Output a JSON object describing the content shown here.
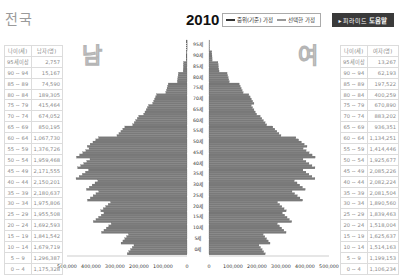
{
  "header": {
    "region": "전국",
    "year": "2010",
    "legend": {
      "baseline_label": "중위(기준) 가정",
      "selected_label": "선택한 가정"
    },
    "help_button": {
      "prefix": "▸ 피라미드",
      "label": "도움말"
    }
  },
  "male_table": {
    "headers": [
      "나이(세)",
      "남자(명)"
    ],
    "big_char": "남",
    "rows": [
      {
        "age": "95세이상",
        "value": "2,757"
      },
      {
        "age": "90 ~ 94",
        "value": "15,167"
      },
      {
        "age": "85 ~ 89",
        "value": "74,590"
      },
      {
        "age": "80 ~ 84",
        "value": "189,305"
      },
      {
        "age": "75 ~ 79",
        "value": "415,464"
      },
      {
        "age": "70 ~ 74",
        "value": "674,052"
      },
      {
        "age": "65 ~ 69",
        "value": "850,195"
      },
      {
        "age": "60 ~ 64",
        "value": "1,067,730"
      },
      {
        "age": "55 ~ 59",
        "value": "1,376,726"
      },
      {
        "age": "50 ~ 54",
        "value": "1,959,468"
      },
      {
        "age": "45 ~ 49",
        "value": "2,171,555"
      },
      {
        "age": "40 ~ 44",
        "value": "2,150,201"
      },
      {
        "age": "35 ~ 39",
        "value": "2,180,637"
      },
      {
        "age": "30 ~ 34",
        "value": "1,975,806"
      },
      {
        "age": "25 ~ 29",
        "value": "1,955,508"
      },
      {
        "age": "20 ~ 24",
        "value": "1,692,593"
      },
      {
        "age": "15 ~ 19",
        "value": "1,841,542"
      },
      {
        "age": "10 ~ 14",
        "value": "1,679,719"
      },
      {
        "age": "5 ~ 9",
        "value": "1,296,387"
      },
      {
        "age": "0 ~ 4",
        "value": "1,175,328"
      }
    ]
  },
  "female_table": {
    "headers": [
      "나이(세)",
      "여자(명)"
    ],
    "big_char": "여",
    "rows": [
      {
        "age": "95세이상",
        "value": "13,267"
      },
      {
        "age": "90 ~ 94",
        "value": "62,193"
      },
      {
        "age": "85 ~ 89",
        "value": "197,522"
      },
      {
        "age": "80 ~ 84",
        "value": "400,259"
      },
      {
        "age": "75 ~ 79",
        "value": "670,890"
      },
      {
        "age": "70 ~ 74",
        "value": "883,202"
      },
      {
        "age": "65 ~ 69",
        "value": "936,351"
      },
      {
        "age": "60 ~ 64",
        "value": "1,134,251"
      },
      {
        "age": "55 ~ 59",
        "value": "1,414,446"
      },
      {
        "age": "50 ~ 54",
        "value": "1,925,677"
      },
      {
        "age": "45 ~ 49",
        "value": "2,085,226"
      },
      {
        "age": "40 ~ 44",
        "value": "2,082,224"
      },
      {
        "age": "35 ~ 39",
        "value": "2,081,504"
      },
      {
        "age": "30 ~ 34",
        "value": "1,890,560"
      },
      {
        "age": "25 ~ 29",
        "value": "1,839,463"
      },
      {
        "age": "20 ~ 24",
        "value": "1,518,004"
      },
      {
        "age": "15 ~ 19",
        "value": "1,625,637"
      },
      {
        "age": "10 ~ 14",
        "value": "1,514,163"
      },
      {
        "age": "5 ~ 9",
        "value": "1,199,153"
      },
      {
        "age": "0 ~ 4",
        "value": "1,106,234"
      }
    ]
  },
  "chart_data": {
    "type": "bar",
    "subtype": "population-pyramid",
    "x_ticks_left": [
      "500,000",
      "400,000",
      "300,000",
      "200,000",
      "100,000",
      "0"
    ],
    "x_ticks_right": [
      "0",
      "100,000",
      "200,000",
      "300,000",
      "400,000",
      "500,000"
    ],
    "xlim": [
      0,
      500000
    ],
    "age_labels": [
      "95세",
      "90세",
      "85세",
      "80세",
      "75세",
      "70세",
      "65세",
      "60세",
      "55세",
      "50세",
      "45세",
      "40세",
      "35세",
      "30세",
      "25세",
      "20세",
      "15세",
      "10세",
      "5세",
      "0세"
    ],
    "categories": [
      "95+",
      "90-94",
      "85-89",
      "80-84",
      "75-79",
      "70-74",
      "65-69",
      "60-64",
      "55-59",
      "50-54",
      "45-49",
      "40-44",
      "35-39",
      "30-34",
      "25-29",
      "20-24",
      "15-19",
      "10-14",
      "5-9",
      "0-4"
    ],
    "series": [
      {
        "name": "남자",
        "side": "left",
        "values": [
          2757,
          15167,
          74590,
          189305,
          415464,
          674052,
          850195,
          1067730,
          1376726,
          1959468,
          2171555,
          2150201,
          2180637,
          1975806,
          1955508,
          1692593,
          1841542,
          1679719,
          1296387,
          1175328
        ]
      },
      {
        "name": "여자",
        "side": "right",
        "values": [
          13267,
          62193,
          197522,
          400259,
          670890,
          883202,
          936351,
          1134251,
          1414446,
          1925677,
          2085226,
          2082224,
          2081504,
          1890560,
          1839463,
          1518004,
          1625637,
          1514163,
          1199153,
          1106234
        ]
      }
    ],
    "note": "Bars drawn per single year of age (grouped values ÷ 5); x-axis in persons per single-year age.",
    "grid": false,
    "legend": [
      "중위(기준) 가정",
      "선택한 가정"
    ]
  },
  "colors": {
    "bar_fill": "#7a7a7a",
    "bar_stroke": "#555555",
    "help_bg": "#3a3a3a",
    "table_border": "#dcdcdc",
    "table_text": "#8a8a8a"
  }
}
